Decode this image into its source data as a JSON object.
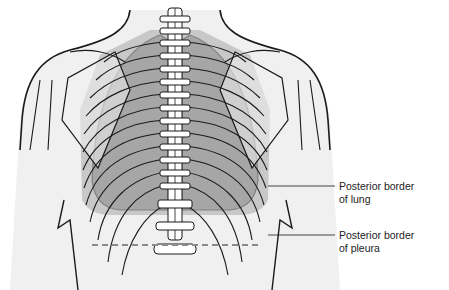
{
  "diagram": {
    "type": "anatomical illustration",
    "colors": {
      "background": "#ffffff",
      "skin_fill": "#f0f0f0",
      "outline": "#1a1a1a",
      "lung_fill": "#a6a6a6",
      "pleura_fill": "#c8c8c8",
      "bone_fill": "#ffffff",
      "dashed_line": "#8a8a8a"
    },
    "labels": [
      {
        "line1": "Posterior border",
        "line2": "of lung"
      },
      {
        "line1": "Posterior border",
        "line2": "of pleura"
      }
    ]
  }
}
